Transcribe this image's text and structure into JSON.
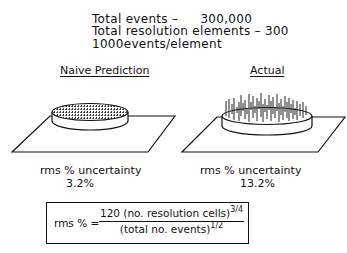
{
  "header": {
    "line1_label": "Total events –",
    "line1_value": "300,000",
    "line2": "Total resolution elements – 300",
    "line3": "1000events/element"
  },
  "panels": [
    {
      "title": "Naive Prediction",
      "metric_label": "rms % uncertainty",
      "metric_value": "3.2%",
      "icon": "uniform-disk-icon"
    },
    {
      "title": "Actual",
      "metric_label": "rms % uncertainty",
      "metric_value": "13.2%",
      "icon": "spiky-disk-icon"
    }
  ],
  "formula": {
    "lhs": "rms % =",
    "numerator": "120 (no. resolution cells)",
    "numerator_exp": "3/4",
    "denominator": "(total no. events)",
    "denominator_exp": "1/2"
  }
}
